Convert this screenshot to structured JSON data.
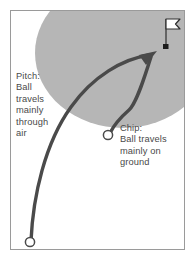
{
  "figure": {
    "title": "",
    "background_color": "#ffffff",
    "frame_color": "#9a9a9a",
    "green_color": "#b6b6b6",
    "trajectory_color": "#4a4a4a",
    "ball_fill": "#ffffff",
    "flag_color": "#4a4a4a",
    "text_color": "#4a4a4a"
  },
  "annotations": {
    "pitch": {
      "lines": [
        "Pitch:",
        "Ball",
        "travels",
        "mainly",
        "through",
        "air"
      ],
      "text": "Pitch:\nBall\ntravels\nmainly\nthrough\nair"
    },
    "chip": {
      "lines": [
        "Chip:",
        "Ball travels",
        "mainly on",
        "ground"
      ],
      "text": "Chip:\nBall travels\nmainly on\nground"
    }
  },
  "elements": {
    "green": {
      "name": "putting-green-ellipse",
      "shape": "ellipse"
    },
    "flag": {
      "name": "flag-on-pin",
      "shape": "pennant"
    },
    "hole": {
      "name": "hole-marker",
      "shape": "square"
    },
    "pitch_ball": {
      "name": "pitch-ball-marker",
      "shape": "circle"
    },
    "chip_ball": {
      "name": "chip-ball-marker",
      "shape": "circle"
    },
    "pitch_path": {
      "name": "pitch-trajectory",
      "shape": "high-arc"
    },
    "chip_path": {
      "name": "chip-trajectory",
      "shape": "low-arc"
    },
    "arrow": {
      "name": "trajectory-arrowhead",
      "shape": "triangle"
    }
  }
}
